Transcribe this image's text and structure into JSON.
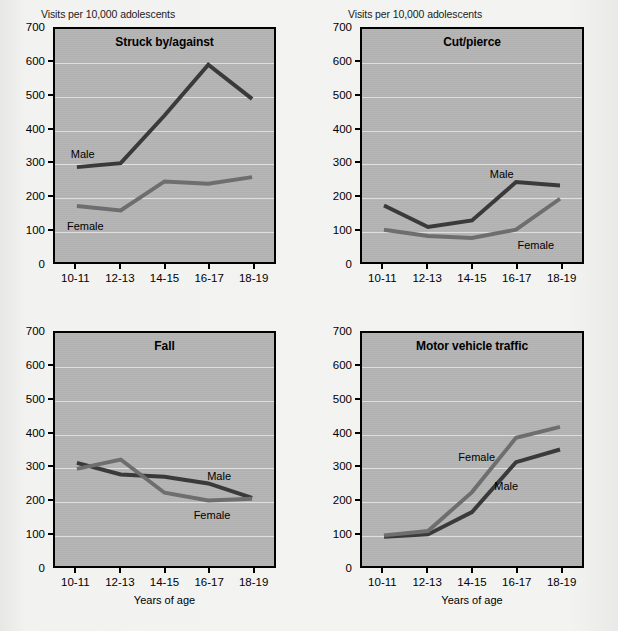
{
  "figure": {
    "y_axis_caption": "Visits per 10,000 adolescents",
    "x_axis_caption": "Years of age",
    "series_label_male": "Male",
    "series_label_female": "Female",
    "colors": {
      "male_line": "#3a3a3a",
      "female_line": "#6e6e6e",
      "plot_background": "#b4b4b4",
      "gridline": "#e6e6e6",
      "axis": "#000000",
      "page_background": "#f1f1f0"
    }
  },
  "chart_data": [
    {
      "type": "line",
      "title": "Struck by/against",
      "xlabel": "",
      "ylabel": "Visits per 10,000 adolescents",
      "categories": [
        "10-11",
        "12-13",
        "14-15",
        "16-17",
        "18-19"
      ],
      "ylim": [
        0,
        700
      ],
      "yticks": [
        0,
        100,
        200,
        300,
        400,
        500,
        600,
        700
      ],
      "grid": true,
      "legend": "inline-labels",
      "series": [
        {
          "name": "Male",
          "values": [
            285,
            297,
            440,
            593,
            490
          ]
        },
        {
          "name": "Female",
          "values": [
            168,
            155,
            242,
            235,
            255
          ]
        }
      ],
      "annotations": [
        {
          "text": "Male",
          "x_index": 0.12,
          "value": 330
        },
        {
          "text": "Female",
          "x_index": 0.18,
          "value": 118
        }
      ]
    },
    {
      "type": "line",
      "title": "Cut/pierce",
      "xlabel": "",
      "ylabel": "Visits per 10,000 adolescents",
      "categories": [
        "10-11",
        "12-13",
        "14-15",
        "16-17",
        "18-19"
      ],
      "ylim": [
        0,
        700
      ],
      "yticks": [
        0,
        100,
        200,
        300,
        400,
        500,
        600,
        700
      ],
      "grid": true,
      "legend": "inline-labels",
      "series": [
        {
          "name": "Male",
          "values": [
            170,
            105,
            125,
            240,
            230
          ]
        },
        {
          "name": "Female",
          "values": [
            97,
            78,
            72,
            97,
            190
          ]
        }
      ],
      "annotations": [
        {
          "text": "Male",
          "x_index": 2.62,
          "value": 272
        },
        {
          "text": "Female",
          "x_index": 3.38,
          "value": 62
        }
      ]
    },
    {
      "type": "line",
      "title": "Fall",
      "xlabel": "Years of age",
      "ylabel": "Visits per 10,000 adolescents",
      "categories": [
        "10-11",
        "12-13",
        "14-15",
        "16-17",
        "18-19"
      ],
      "ylim": [
        0,
        700
      ],
      "yticks": [
        0,
        100,
        200,
        300,
        400,
        500,
        600,
        700
      ],
      "grid": true,
      "legend": "inline-labels",
      "series": [
        {
          "name": "Male",
          "values": [
            310,
            275,
            268,
            248,
            205
          ]
        },
        {
          "name": "Female",
          "values": [
            292,
            320,
            220,
            197,
            202
          ]
        }
      ],
      "annotations": [
        {
          "text": "Male",
          "x_index": 3.18,
          "value": 278
        },
        {
          "text": "Female",
          "x_index": 3.02,
          "value": 162
        }
      ]
    },
    {
      "type": "line",
      "title": "Motor vehicle traffic",
      "xlabel": "Years of age",
      "ylabel": "Visits per 10,000 adolescents",
      "categories": [
        "10-11",
        "12-13",
        "14-15",
        "16-17",
        "18-19"
      ],
      "ylim": [
        0,
        700
      ],
      "yticks": [
        0,
        100,
        200,
        300,
        400,
        500,
        600,
        700
      ],
      "grid": true,
      "legend": "inline-labels",
      "series": [
        {
          "name": "Male",
          "values": [
            88,
            95,
            162,
            312,
            350
          ]
        },
        {
          "name": "Female",
          "values": [
            92,
            105,
            222,
            385,
            418
          ]
        }
      ],
      "annotations": [
        {
          "text": "Female",
          "x_index": 2.06,
          "value": 335
        },
        {
          "text": "Male",
          "x_index": 2.72,
          "value": 248
        }
      ]
    }
  ]
}
